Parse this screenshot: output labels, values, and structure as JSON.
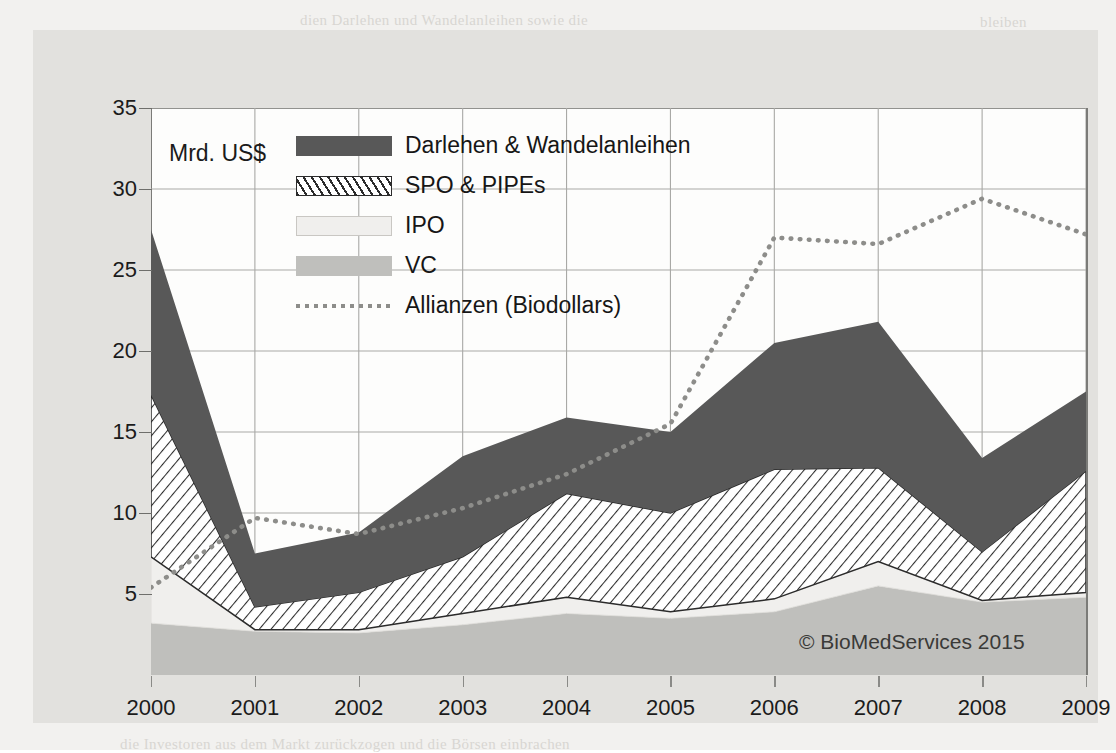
{
  "figure": {
    "axis_unit_label": "Mrd. US$",
    "copyright": "© BioMedServices 2015"
  },
  "legend": {
    "items": [
      {
        "label": "Darlehen & Wandelanleihen",
        "swatch": "dark-fill-swatch"
      },
      {
        "label": "SPO & PIPEs",
        "swatch": "hatched-fill-swatch"
      },
      {
        "label": "IPO",
        "swatch": "light-fill-swatch"
      },
      {
        "label": "VC",
        "swatch": "gray-fill-swatch"
      },
      {
        "label": "Allianzen (Biodollars)",
        "swatch": "dotted-line-swatch"
      }
    ]
  },
  "chart_data": {
    "type": "area",
    "title": "",
    "subtitle": "",
    "xlabel": "",
    "ylabel": "Mrd. US$",
    "categories": [
      "2000",
      "2001",
      "2002",
      "2003",
      "2004",
      "2005",
      "2006",
      "2007",
      "2008",
      "2009"
    ],
    "x": [
      2000,
      2001,
      2002,
      2003,
      2004,
      2005,
      2006,
      2007,
      2008,
      2009
    ],
    "ylim": [
      0,
      35
    ],
    "yticks": [
      0,
      5,
      10,
      15,
      20,
      25,
      30,
      35
    ],
    "ytick_labels": [
      "",
      "5",
      "10",
      "15",
      "20",
      "25",
      "30",
      "35"
    ],
    "grid": true,
    "legend_position": "inside-top-left",
    "stacked": true,
    "stack_order_bottom_to_top": [
      "VC",
      "IPO",
      "SPO & PIPEs",
      "Darlehen & Wandelanleihen"
    ],
    "series": [
      {
        "name": "VC",
        "type": "area",
        "color": "#bfbfbc",
        "values": [
          3.2,
          2.7,
          2.6,
          3.1,
          3.8,
          3.5,
          3.9,
          5.5,
          4.5,
          4.8
        ]
      },
      {
        "name": "IPO",
        "type": "area",
        "color": "#f0efed",
        "values": [
          4.1,
          0.1,
          0.2,
          0.7,
          1.0,
          0.4,
          0.8,
          1.5,
          0.1,
          0.3
        ]
      },
      {
        "name": "SPO & PIPEs",
        "type": "area",
        "color": "#ffffff",
        "hatched": true,
        "values": [
          10.0,
          1.4,
          2.3,
          3.5,
          6.4,
          6.1,
          8.0,
          5.8,
          3.0,
          7.5
        ]
      },
      {
        "name": "Darlehen & Wandelanleihen",
        "type": "area",
        "color": "#585858",
        "values": [
          10.2,
          3.3,
          3.7,
          6.2,
          4.7,
          5.0,
          7.8,
          9.0,
          5.8,
          4.9
        ]
      }
    ],
    "cumulative_totals": [
      27.5,
      7.5,
      8.8,
      13.5,
      15.9,
      15.0,
      20.5,
      21.8,
      13.4,
      17.5
    ],
    "overlay_series": [
      {
        "name": "Allianzen (Biodollars)",
        "type": "line",
        "style": "dotted",
        "color": "#8d8d8a",
        "values": [
          5.4,
          9.7,
          8.7,
          10.3,
          12.4,
          15.5,
          27.0,
          26.6,
          29.4,
          27.2
        ]
      }
    ]
  },
  "axes": {
    "y_ticks": [
      "35",
      "30",
      "25",
      "20",
      "15",
      "10",
      "5"
    ],
    "x_ticks": [
      "2000",
      "2001",
      "2002",
      "2003",
      "2004",
      "2005",
      "2006",
      "2007",
      "2008",
      "2009"
    ]
  },
  "ghost_lines": [
    {
      "x": 300,
      "y": 12,
      "text": "dien  Darlehen und Wandelanleihen sowie die"
    },
    {
      "x": 980,
      "y": 14,
      "text": "bleiben"
    },
    {
      "x": 60,
      "y": 300,
      "text": "und"
    },
    {
      "x": 190,
      "y": 312,
      "text": "wurde  von  einer  Rekordsumme  an"
    },
    {
      "x": 745,
      "y": 300,
      "text": "neuen  Beteiligungen"
    },
    {
      "x": 80,
      "y": 346,
      "text": "hohe"
    },
    {
      "x": 170,
      "y": 348,
      "text": "Allianzen  waren  auch  2008  und  2009  wieder  auf  einem"
    },
    {
      "x": 915,
      "y": 342,
      "text": "hohen"
    },
    {
      "x": 60,
      "y": 388,
      "text": "Niveau"
    },
    {
      "x": 200,
      "y": 386,
      "text": "der  Kapitalbeschaffung  im  Biotech-Sektor"
    },
    {
      "x": 62,
      "y": 448,
      "text": "das"
    },
    {
      "x": 980,
      "y": 452,
      "text": "sie"
    },
    {
      "x": 56,
      "y": 700,
      "text": "Jahr"
    },
    {
      "x": 300,
      "y": 702,
      "text": "ging  die  Finanzierung  deutlich  zurück,  da  sich"
    },
    {
      "x": 120,
      "y": 736,
      "text": "die  Investoren  aus  dem  Markt  zurückzogen  und  die  Börsen  einbrachen"
    }
  ]
}
